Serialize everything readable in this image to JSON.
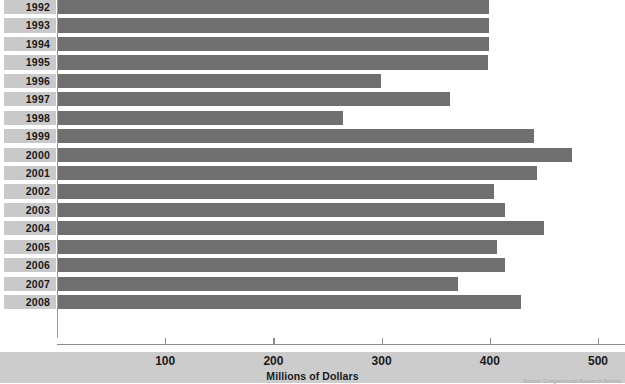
{
  "chart_data": {
    "type": "bar",
    "orientation": "horizontal",
    "title": "",
    "xlabel": "Millions of Dollars",
    "ylabel": "",
    "xlim": [
      0,
      520
    ],
    "xticks": [
      100,
      200,
      300,
      400,
      500
    ],
    "xtick_labels": [
      "100",
      "200",
      "300",
      "400",
      "500"
    ],
    "grid": false,
    "legend": null,
    "bar_color": "#6f6f6f",
    "categories": [
      "1992",
      "1993",
      "1994",
      "1995",
      "1996",
      "1997",
      "1998",
      "1999",
      "2000",
      "2001",
      "2002",
      "2003",
      "2004",
      "2005",
      "2006",
      "2007",
      "2008"
    ],
    "values": [
      399,
      399,
      399,
      398,
      299,
      363,
      264,
      441,
      476,
      444,
      404,
      414,
      450,
      407,
      414,
      371,
      429
    ],
    "series": [
      {
        "name": "Millions of Dollars",
        "values": [
          399,
          399,
          399,
          398,
          299,
          363,
          264,
          441,
          476,
          444,
          404,
          414,
          450,
          407,
          414,
          371,
          429
        ]
      }
    ],
    "source": "Source: Congressional Research Service"
  },
  "axis": {
    "x_title": "Millions of Dollars"
  },
  "footer": {
    "source": "Source: Congressional Research Service"
  }
}
